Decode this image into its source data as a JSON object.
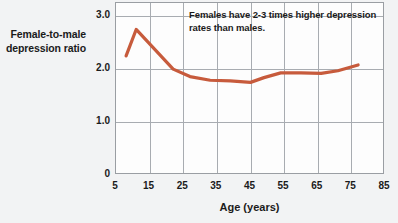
{
  "chart_data": {
    "type": "line",
    "title": "",
    "xlabel": "Age (years)",
    "ylabel": "Female-to-male depression ratio",
    "xlim": [
      5,
      85
    ],
    "ylim": [
      0,
      3.25
    ],
    "xticks": [
      5,
      15,
      25,
      35,
      45,
      55,
      65,
      75,
      85
    ],
    "xtick_labels": [
      "5",
      "15",
      "25",
      "35",
      "45",
      "55",
      "65",
      "75",
      "85"
    ],
    "yticks": [
      0,
      1.0,
      2.0,
      3.0
    ],
    "ytick_labels": [
      "0",
      "1.0",
      "2.0",
      "3.0"
    ],
    "grid": "both",
    "legend": "none",
    "line_color": "#c75b3c",
    "line_width": 3.2,
    "series": [
      {
        "name": "Female-to-male depression ratio",
        "x": [
          8,
          11,
          22,
          27,
          33,
          39,
          45,
          49,
          54,
          60,
          66,
          71,
          77
        ],
        "y": [
          2.25,
          2.75,
          2.0,
          1.86,
          1.79,
          1.78,
          1.75,
          1.84,
          1.93,
          1.93,
          1.92,
          1.97,
          2.08
        ]
      }
    ],
    "annotations": [
      {
        "name": "ratio-note",
        "text": "Females have 2-3 times higher depression rates than males.",
        "x": 38,
        "y": 3.05
      }
    ]
  },
  "figure": {
    "background_color": "#f2f3f4",
    "plot_background_color": "#fdfdfd",
    "grid_color": "#a8acb1",
    "frame_color": "#9a9ea3",
    "text_color": "#1b1b1b"
  }
}
